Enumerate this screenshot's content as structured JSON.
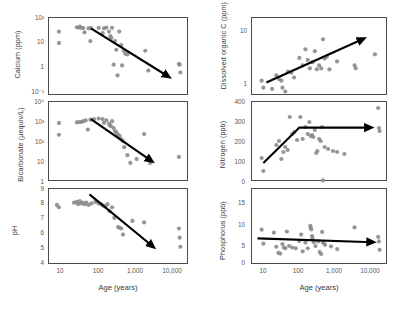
{
  "figure": {
    "title": "",
    "background": "#ffffff",
    "dot_color": "#8b8b8b",
    "arrow_color": "#000000",
    "axis_color": "#4a4a4a"
  },
  "axes": {
    "x_label": "Age (years)",
    "x_ticks": [
      "10",
      "100",
      "1,000",
      "10,000"
    ],
    "x_scale": "log",
    "x_min": 5,
    "x_max": 20000
  },
  "chart_data": [
    {
      "type": "scatter",
      "name": "calcium",
      "title": "",
      "ylabel": "Calcium (ppm)",
      "xlabel": "Age (years)",
      "xscale": "log",
      "yscale": "log",
      "xlim": [
        5,
        20000
      ],
      "ylim": [
        0.1,
        100
      ],
      "y_ticks": [
        "10²",
        "10",
        "1",
        "10⁻¹"
      ],
      "y_tick_values": [
        100,
        10,
        1,
        0.1
      ],
      "grid": false,
      "legend": "none",
      "trend": {
        "shape": "line",
        "direction": "decreasing",
        "x_start": 60,
        "y_start": 40,
        "x_end": 6000,
        "y_end": 0.55
      },
      "points": [
        {
          "x": 9,
          "y": 30
        },
        {
          "x": 9,
          "y": 11
        },
        {
          "x": 26,
          "y": 44
        },
        {
          "x": 29,
          "y": 43
        },
        {
          "x": 31,
          "y": 47
        },
        {
          "x": 34,
          "y": 42
        },
        {
          "x": 38,
          "y": 41
        },
        {
          "x": 41,
          "y": 28
        },
        {
          "x": 52,
          "y": 40
        },
        {
          "x": 58,
          "y": 13
        },
        {
          "x": 60,
          "y": 41
        },
        {
          "x": 95,
          "y": 42
        },
        {
          "x": 120,
          "y": 26
        },
        {
          "x": 130,
          "y": 40
        },
        {
          "x": 150,
          "y": 43
        },
        {
          "x": 175,
          "y": 30
        },
        {
          "x": 190,
          "y": 20
        },
        {
          "x": 200,
          "y": 17
        },
        {
          "x": 210,
          "y": 42
        },
        {
          "x": 230,
          "y": 1.6
        },
        {
          "x": 250,
          "y": 13
        },
        {
          "x": 270,
          "y": 6
        },
        {
          "x": 290,
          "y": 0.62
        },
        {
          "x": 320,
          "y": 30
        },
        {
          "x": 360,
          "y": 9
        },
        {
          "x": 380,
          "y": 1.5
        },
        {
          "x": 420,
          "y": 5.5
        },
        {
          "x": 460,
          "y": 4.2
        },
        {
          "x": 520,
          "y": 4.0
        },
        {
          "x": 1500,
          "y": 5.5
        },
        {
          "x": 1800,
          "y": 0.95
        },
        {
          "x": 11000,
          "y": 1.7
        },
        {
          "x": 11500,
          "y": 1.6
        },
        {
          "x": 12000,
          "y": 0.8
        }
      ]
    },
    {
      "type": "scatter",
      "name": "bicarbonate",
      "title": "",
      "ylabel": "Bicarbonate (µequiv/L)",
      "xlabel": "Age (years)",
      "xscale": "log",
      "yscale": "log",
      "xlim": [
        5,
        20000
      ],
      "ylim": [
        1,
        10000
      ],
      "y_ticks": [
        "10⁴",
        "10³",
        "10²",
        "10",
        "1"
      ],
      "y_tick_values": [
        10000,
        1000,
        100,
        10,
        1
      ],
      "grid": false,
      "legend": "none",
      "trend": {
        "shape": "line",
        "direction": "decreasing",
        "x_start": 60,
        "y_start": 1400,
        "x_end": 2200,
        "y_end": 11
      },
      "points": [
        {
          "x": 9,
          "y": 900
        },
        {
          "x": 9,
          "y": 230
        },
        {
          "x": 26,
          "y": 950
        },
        {
          "x": 30,
          "y": 1000
        },
        {
          "x": 34,
          "y": 1000
        },
        {
          "x": 38,
          "y": 1100
        },
        {
          "x": 44,
          "y": 1200
        },
        {
          "x": 50,
          "y": 420
        },
        {
          "x": 58,
          "y": 1300
        },
        {
          "x": 72,
          "y": 1400
        },
        {
          "x": 95,
          "y": 1500
        },
        {
          "x": 120,
          "y": 1400
        },
        {
          "x": 130,
          "y": 900
        },
        {
          "x": 150,
          "y": 1200
        },
        {
          "x": 175,
          "y": 800
        },
        {
          "x": 185,
          "y": 700
        },
        {
          "x": 195,
          "y": 620
        },
        {
          "x": 210,
          "y": 1100
        },
        {
          "x": 230,
          "y": 500
        },
        {
          "x": 250,
          "y": 350
        },
        {
          "x": 270,
          "y": 300
        },
        {
          "x": 300,
          "y": 230
        },
        {
          "x": 330,
          "y": 200
        },
        {
          "x": 360,
          "y": 140
        },
        {
          "x": 400,
          "y": 110
        },
        {
          "x": 430,
          "y": 55
        },
        {
          "x": 520,
          "y": 22
        },
        {
          "x": 620,
          "y": 9
        },
        {
          "x": 900,
          "y": 14
        },
        {
          "x": 1400,
          "y": 250
        },
        {
          "x": 2000,
          "y": 9
        },
        {
          "x": 11000,
          "y": 18
        }
      ]
    },
    {
      "type": "scatter",
      "name": "ph",
      "title": "",
      "ylabel": "pH",
      "xlabel": "Age (years)",
      "xscale": "log",
      "yscale": "linear",
      "xlim": [
        5,
        20000
      ],
      "ylim": [
        4,
        9
      ],
      "y_ticks": [
        "9",
        "8",
        "7",
        "6",
        "5",
        "4"
      ],
      "y_tick_values": [
        9,
        8,
        7,
        6,
        5,
        4
      ],
      "grid": false,
      "legend": "none",
      "trend": {
        "shape": "line",
        "direction": "decreasing",
        "x_start": 55,
        "y_start": 8.65,
        "x_end": 2400,
        "y_end": 5.2
      },
      "points": [
        {
          "x": 8,
          "y": 7.95
        },
        {
          "x": 9,
          "y": 7.8
        },
        {
          "x": 22,
          "y": 8.1
        },
        {
          "x": 26,
          "y": 8.15
        },
        {
          "x": 28,
          "y": 8.0
        },
        {
          "x": 31,
          "y": 8.2
        },
        {
          "x": 34,
          "y": 8.05
        },
        {
          "x": 37,
          "y": 8.1
        },
        {
          "x": 41,
          "y": 8.0
        },
        {
          "x": 46,
          "y": 8.1
        },
        {
          "x": 52,
          "y": 7.95
        },
        {
          "x": 62,
          "y": 8.05
        },
        {
          "x": 78,
          "y": 8.15
        },
        {
          "x": 95,
          "y": 8.05
        },
        {
          "x": 110,
          "y": 8.0
        },
        {
          "x": 125,
          "y": 7.9
        },
        {
          "x": 140,
          "y": 7.85
        },
        {
          "x": 160,
          "y": 8.0
        },
        {
          "x": 180,
          "y": 7.55
        },
        {
          "x": 210,
          "y": 7.8
        },
        {
          "x": 240,
          "y": 7.1
        },
        {
          "x": 300,
          "y": 6.5
        },
        {
          "x": 330,
          "y": 6.45
        },
        {
          "x": 360,
          "y": 6.4
        },
        {
          "x": 400,
          "y": 6.0
        },
        {
          "x": 700,
          "y": 6.9
        },
        {
          "x": 1400,
          "y": 6.8
        },
        {
          "x": 11000,
          "y": 6.4
        },
        {
          "x": 11500,
          "y": 5.8
        },
        {
          "x": 12000,
          "y": 5.2
        }
      ]
    },
    {
      "type": "scatter",
      "name": "dissolved_organic_carbon",
      "title": "",
      "ylabel": "Dissolved organic C (ppm)",
      "xlabel": "Age (years)",
      "xscale": "log",
      "yscale": "log",
      "xlim": [
        5,
        20000
      ],
      "ylim": [
        0.7,
        20
      ],
      "y_ticks": [
        "10",
        "1"
      ],
      "y_tick_values": [
        10,
        1
      ],
      "grid": false,
      "legend": "none",
      "trend": {
        "shape": "line",
        "direction": "increasing",
        "x_start": 12,
        "y_start": 1.25,
        "x_end": 4500,
        "y_end": 8.2
      },
      "points": [
        {
          "x": 9,
          "y": 1.35
        },
        {
          "x": 10,
          "y": 1.0
        },
        {
          "x": 17,
          "y": 0.95
        },
        {
          "x": 22,
          "y": 1.7
        },
        {
          "x": 26,
          "y": 1.45
        },
        {
          "x": 30,
          "y": 1.35
        },
        {
          "x": 32,
          "y": 1.0
        },
        {
          "x": 38,
          "y": 0.85
        },
        {
          "x": 45,
          "y": 2.0
        },
        {
          "x": 55,
          "y": 1.9
        },
        {
          "x": 65,
          "y": 1.55
        },
        {
          "x": 90,
          "y": 3.6
        },
        {
          "x": 110,
          "y": 2.6
        },
        {
          "x": 130,
          "y": 5.2
        },
        {
          "x": 150,
          "y": 3.3
        },
        {
          "x": 170,
          "y": 2.3
        },
        {
          "x": 200,
          "y": 3.0
        },
        {
          "x": 230,
          "y": 4.8
        },
        {
          "x": 260,
          "y": 2.2
        },
        {
          "x": 300,
          "y": 2.6
        },
        {
          "x": 340,
          "y": 2.3
        },
        {
          "x": 380,
          "y": 8.0
        },
        {
          "x": 420,
          "y": 3.5
        },
        {
          "x": 480,
          "y": 3.8
        },
        {
          "x": 560,
          "y": 2.2
        },
        {
          "x": 900,
          "y": 3.1
        },
        {
          "x": 2600,
          "y": 2.6
        },
        {
          "x": 2800,
          "y": 2.3
        },
        {
          "x": 9000,
          "y": 4.2
        }
      ]
    },
    {
      "type": "scatter",
      "name": "nitrogen",
      "title": "",
      "ylabel": "Nitrogen (ppb)",
      "xlabel": "Age (years)",
      "xscale": "log",
      "yscale": "linear",
      "xlim": [
        5,
        20000
      ],
      "ylim": [
        0,
        400
      ],
      "y_ticks": [
        "400",
        "300",
        "200",
        "100",
        "0"
      ],
      "y_tick_values": [
        400,
        300,
        200,
        100,
        0
      ],
      "grid": false,
      "legend": "none",
      "trend": {
        "shape": "hockey-stick",
        "direction": "increasing-then-flat",
        "x_start": 10,
        "y_start": 95,
        "x_break": 90,
        "y_break": 272,
        "x_end": 7000,
        "y_end": 272
      },
      "points": [
        {
          "x": 9,
          "y": 120
        },
        {
          "x": 10,
          "y": 55
        },
        {
          "x": 22,
          "y": 185
        },
        {
          "x": 26,
          "y": 205
        },
        {
          "x": 30,
          "y": 115
        },
        {
          "x": 34,
          "y": 150
        },
        {
          "x": 38,
          "y": 175
        },
        {
          "x": 44,
          "y": 160
        },
        {
          "x": 50,
          "y": 325
        },
        {
          "x": 58,
          "y": 240
        },
        {
          "x": 66,
          "y": 250
        },
        {
          "x": 78,
          "y": 210
        },
        {
          "x": 95,
          "y": 325
        },
        {
          "x": 110,
          "y": 215
        },
        {
          "x": 130,
          "y": 275
        },
        {
          "x": 150,
          "y": 240
        },
        {
          "x": 165,
          "y": 300
        },
        {
          "x": 180,
          "y": 230
        },
        {
          "x": 195,
          "y": 235
        },
        {
          "x": 210,
          "y": 225
        },
        {
          "x": 230,
          "y": 260
        },
        {
          "x": 250,
          "y": 145
        },
        {
          "x": 270,
          "y": 155
        },
        {
          "x": 300,
          "y": 215
        },
        {
          "x": 330,
          "y": 205
        },
        {
          "x": 360,
          "y": 275
        },
        {
          "x": 380,
          "y": 8
        },
        {
          "x": 420,
          "y": 175
        },
        {
          "x": 520,
          "y": 165
        },
        {
          "x": 700,
          "y": 155
        },
        {
          "x": 900,
          "y": 150
        },
        {
          "x": 1400,
          "y": 140
        },
        {
          "x": 11000,
          "y": 370
        },
        {
          "x": 11500,
          "y": 270
        },
        {
          "x": 12000,
          "y": 255
        }
      ]
    },
    {
      "type": "scatter",
      "name": "phosphorus",
      "title": "",
      "ylabel": "Phosphorus (ppb)",
      "xlabel": "Age (years)",
      "xscale": "log",
      "yscale": "linear",
      "xlim": [
        5,
        20000
      ],
      "ylim": [
        0,
        20
      ],
      "y_ticks": [
        "20",
        "15",
        "10",
        "5",
        "0"
      ],
      "y_tick_values": [
        20,
        15,
        10,
        5,
        0
      ],
      "grid": false,
      "legend": "none",
      "trend": {
        "shape": "line",
        "direction": "slightly-decreasing",
        "x_start": 7,
        "y_start": 7.0,
        "x_end": 8000,
        "y_end": 6.0
      },
      "points": [
        {
          "x": 9,
          "y": 9.3
        },
        {
          "x": 10,
          "y": 5.6
        },
        {
          "x": 19,
          "y": 8.5
        },
        {
          "x": 22,
          "y": 4.8
        },
        {
          "x": 25,
          "y": 3.2
        },
        {
          "x": 28,
          "y": 3.0
        },
        {
          "x": 32,
          "y": 5.5
        },
        {
          "x": 35,
          "y": 4.6
        },
        {
          "x": 38,
          "y": 4.4
        },
        {
          "x": 42,
          "y": 8.8
        },
        {
          "x": 48,
          "y": 5.0
        },
        {
          "x": 58,
          "y": 4.6
        },
        {
          "x": 72,
          "y": 4.4
        },
        {
          "x": 90,
          "y": 6.3
        },
        {
          "x": 100,
          "y": 8.0
        },
        {
          "x": 110,
          "y": 3.6
        },
        {
          "x": 130,
          "y": 5.9
        },
        {
          "x": 150,
          "y": 4.4
        },
        {
          "x": 175,
          "y": 10.3
        },
        {
          "x": 180,
          "y": 9.8
        },
        {
          "x": 185,
          "y": 9.4
        },
        {
          "x": 195,
          "y": 7.6
        },
        {
          "x": 200,
          "y": 7.0
        },
        {
          "x": 215,
          "y": 6.0
        },
        {
          "x": 240,
          "y": 5.0
        },
        {
          "x": 280,
          "y": 6.2
        },
        {
          "x": 310,
          "y": 3.4
        },
        {
          "x": 340,
          "y": 2.9
        },
        {
          "x": 360,
          "y": 8.7
        },
        {
          "x": 380,
          "y": 6.0
        },
        {
          "x": 400,
          "y": 5.7
        },
        {
          "x": 430,
          "y": 5.3
        },
        {
          "x": 620,
          "y": 4.9
        },
        {
          "x": 900,
          "y": 4.2
        },
        {
          "x": 2600,
          "y": 9.9
        },
        {
          "x": 11000,
          "y": 7.4
        },
        {
          "x": 11500,
          "y": 6.2
        },
        {
          "x": 12000,
          "y": 4.0
        }
      ]
    }
  ]
}
